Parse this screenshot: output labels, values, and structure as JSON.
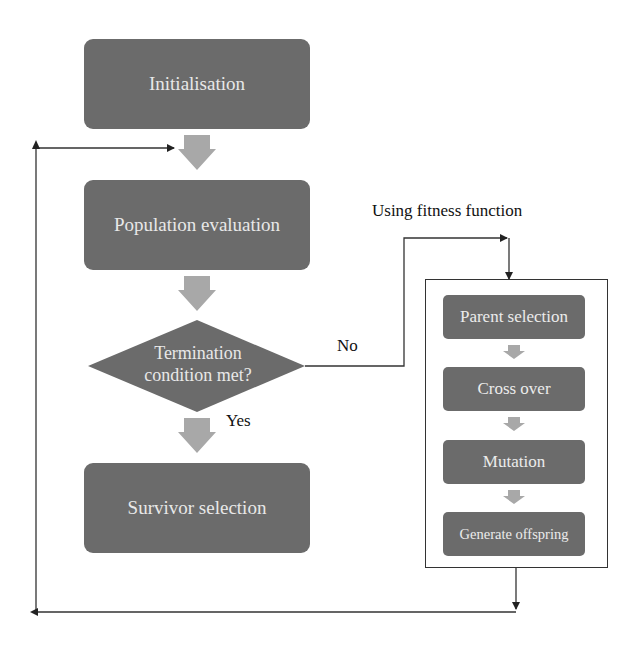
{
  "diagram": {
    "type": "flowchart",
    "colors": {
      "node_fill": "#6b6b6b",
      "node_text": "#e8e8e8",
      "block_arrow": "#a8a8a8",
      "connector": "#333333",
      "background": "#ffffff"
    },
    "main_flow": {
      "initialisation": "Initialisation",
      "population_evaluation": "Population evaluation",
      "decision": {
        "line1": "Termination",
        "line2": "condition met?"
      },
      "survivor_selection": "Survivor selection"
    },
    "edge_labels": {
      "yes": "Yes",
      "no": "No",
      "fitness_note": "Using fitness function"
    },
    "sub_process": {
      "steps": [
        "Parent selection",
        "Cross over",
        "Mutation",
        "Generate offspring"
      ]
    }
  }
}
